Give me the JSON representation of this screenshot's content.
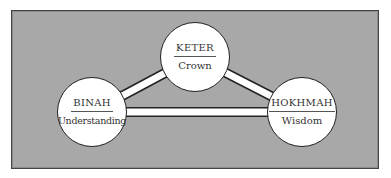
{
  "diagram": {
    "background_color": "#a8a8a8",
    "nodes": [
      {
        "id": "keter",
        "title": "KETER",
        "subtitle": "Crown"
      },
      {
        "id": "binah",
        "title": "BINAH",
        "subtitle": "Understanding"
      },
      {
        "id": "hokhmah",
        "title": "HOKHMAH",
        "subtitle": "Wisdom"
      }
    ],
    "edges": [
      {
        "from": "keter",
        "to": "binah"
      },
      {
        "from": "keter",
        "to": "hokhmah"
      },
      {
        "from": "binah",
        "to": "hokhmah"
      }
    ]
  }
}
